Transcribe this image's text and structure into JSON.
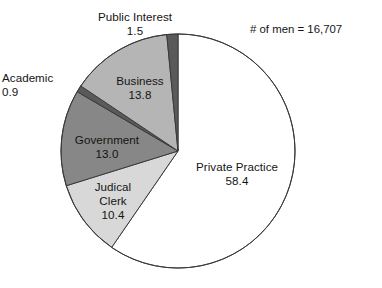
{
  "annotation": {
    "men_count_text": "# of men = 16,707"
  },
  "chart_data": {
    "type": "pie",
    "title": "",
    "subtitle": "",
    "xlabel": "",
    "ylabel": "",
    "units": "percent",
    "total_label": "# of men = 16,707",
    "total_value": 16707,
    "legend_position": "none",
    "grid": false,
    "start_angle_deg": 0,
    "direction": "clockwise",
    "categories": [
      "Private Practice",
      "Judical Clerk",
      "Government",
      "Academic",
      "Business",
      "Public Interest"
    ],
    "values": [
      58.4,
      10.4,
      13.0,
      0.9,
      13.8,
      1.5
    ],
    "slices": [
      {
        "label": "Private Practice",
        "label_lines": [
          "Private Practice"
        ],
        "value": 58.4,
        "value_text": "58.4",
        "color": "#ffffff",
        "label_placement": "inside"
      },
      {
        "label": "Judical Clerk",
        "label_lines": [
          "Judical",
          "Clerk"
        ],
        "value": 10.4,
        "value_text": "10.4",
        "color": "#d8d8d8",
        "label_placement": "inside"
      },
      {
        "label": "Government",
        "label_lines": [
          "Government"
        ],
        "value": 13.0,
        "value_text": "13.0",
        "color": "#878787",
        "label_placement": "inside"
      },
      {
        "label": "Academic",
        "label_lines": [
          "Academic"
        ],
        "value": 0.9,
        "value_text": "0.9",
        "color": "#5a5a5a",
        "label_placement": "outside"
      },
      {
        "label": "Business",
        "label_lines": [
          "Business"
        ],
        "value": 13.8,
        "value_text": "13.8",
        "color": "#b5b5b5",
        "label_placement": "inside"
      },
      {
        "label": "Public Interest",
        "label_lines": [
          "Public Interest"
        ],
        "value": 1.5,
        "value_text": "1.5",
        "color": "#5a5a5a",
        "label_placement": "outside"
      }
    ],
    "geometry": {
      "center_x": 178,
      "center_y": 151,
      "radius": 117,
      "stroke_color": "#3a3a3a",
      "stroke_width": 1
    }
  },
  "labels": {
    "public_interest": {
      "name": "Public Interest",
      "value": "1.5"
    },
    "academic": {
      "name": "Academic",
      "value": "0.9"
    },
    "business": {
      "name": "Business",
      "value": "13.8"
    },
    "government": {
      "name": "Government",
      "value": "13.0"
    },
    "judical_clerk": {
      "name_line1": "Judical",
      "name_line2": "Clerk",
      "value": "10.4"
    },
    "private_practice": {
      "name": "Private Practice",
      "value": "58.4"
    }
  }
}
